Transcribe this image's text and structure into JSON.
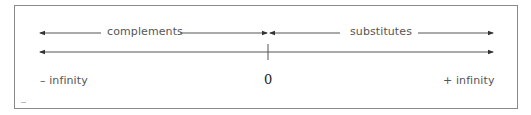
{
  "diagram": {
    "top_left_label": "complements",
    "top_right_label": "substitutes",
    "axis_left_label": "– infinity",
    "axis_center_label": "0",
    "axis_right_label": "+ infinity",
    "line_color": "#555555",
    "text_color": "#555555"
  }
}
